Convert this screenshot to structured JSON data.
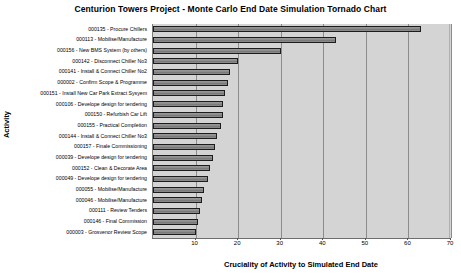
{
  "chart_data": {
    "type": "bar",
    "orientation": "horizontal",
    "title": "Centurion Towers Project - Monte Carlo End Date Simulation Tornado Chart",
    "xlabel": "Cruciality of Activity to Simulated End Date",
    "ylabel": "Activity",
    "xlim": [
      0,
      70
    ],
    "xticks": [
      10,
      20,
      30,
      40,
      50,
      60,
      70
    ],
    "grid": true,
    "legend": "none",
    "categories": [
      "000135 - Procure Chillers",
      "000113 - Mobilise/Manufacture",
      "000156 - New BMS System (by others)",
      "000142 - Disconnect Chiller No3",
      "000141 - Install & Connect Chiller No2",
      "000002 - Confirm Scope & Programme",
      "000151 - Install New Car Park Extract Sysyem",
      "000106 - Develope design for tendering",
      "000150 - Refurbish Car Lift",
      "000155 - Practical Completion",
      "000144 - Install & Connect Chiller No3",
      "000157 - Finale Commissioning",
      "000039 - Develope design for tendering",
      "000152 - Clean & Decorate Area",
      "000049 - Develope design for tendering",
      "000055 - Mobilise/Manufacture",
      "000046 - Mobilise/Manufacture",
      "000111 - Review Tenders",
      "000146 - Final Commission",
      "000003 - Grosvenor Review Scope"
    ],
    "values": [
      63,
      43,
      30,
      20,
      18,
      17.5,
      17,
      16.5,
      16.5,
      16,
      15,
      14.5,
      14,
      13.5,
      13,
      12,
      11.5,
      11,
      10.5,
      10
    ]
  },
  "colors": {
    "bar_fill": "#878787",
    "bar_border": "#1c1c1c",
    "plot_background": "#d4d4d4",
    "gridline": "#8c8c8c",
    "page_background": "#ffffff"
  }
}
